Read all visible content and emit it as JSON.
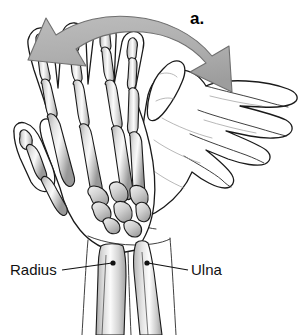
{
  "figure": {
    "panel_label": "a.",
    "caption_labels": [
      {
        "id": "radius",
        "text": "Radius",
        "side": "left"
      },
      {
        "id": "ulna",
        "text": "Ulna",
        "side": "right"
      }
    ],
    "annotations": {
      "rotation_arrow": "curved-double-headed-rotation-arrow"
    },
    "colors": {
      "background": "#ffffff",
      "outline": "#1a1a1a",
      "text": "#111111",
      "arrow_fill": "#b0b0b0",
      "arrow_stroke": "#6f6f6f",
      "bone_light": "#ffffff",
      "bone_mid": "#d2d2d2",
      "bone_dark": "#9a9a9a"
    },
    "structures": {
      "skeletal_hand": "skeletal-hand-pronated",
      "outlined_hand": "outlined-hand-supinated",
      "forearm_bones": [
        "Radius",
        "Ulna"
      ],
      "carpals": "carpal-bone-cluster",
      "metacarpals": "metacarpal-bones",
      "phalanges": "phalanx-bones",
      "thumb": "thumb-phalanges"
    }
  }
}
